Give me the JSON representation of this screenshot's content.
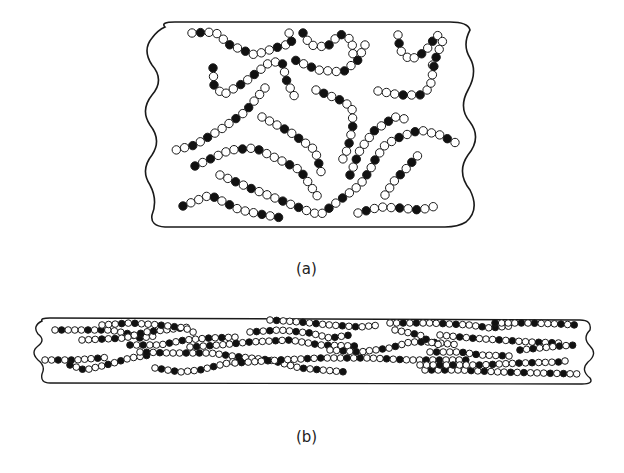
{
  "panel_a": {
    "label": "(a)",
    "description": "Randomly coiled polymer chains (unoriented)",
    "chains": [
      [
        [
          192,
          33
        ],
        [
          215,
          32
        ],
        [
          230,
          45
        ],
        [
          255,
          55
        ],
        [
          275,
          48
        ],
        [
          292,
          43
        ],
        [
          287,
          26
        ]
      ],
      [
        [
          303,
          33
        ],
        [
          310,
          45
        ],
        [
          327,
          47
        ],
        [
          340,
          34
        ],
        [
          352,
          40
        ],
        [
          353,
          55
        ]
      ],
      [
        [
          365,
          45
        ],
        [
          358,
          60
        ],
        [
          343,
          72
        ],
        [
          318,
          70
        ],
        [
          295,
          60
        ]
      ],
      [
        [
          398,
          35
        ],
        [
          400,
          50
        ],
        [
          410,
          60
        ],
        [
          425,
          52
        ],
        [
          437,
          35
        ],
        [
          443,
          40
        ],
        [
          435,
          60
        ],
        [
          430,
          70
        ]
      ],
      [
        [
          213,
          68
        ],
        [
          214,
          85
        ],
        [
          223,
          95
        ],
        [
          245,
          82
        ],
        [
          270,
          62
        ],
        [
          282,
          62
        ],
        [
          287,
          82
        ],
        [
          298,
          103
        ]
      ],
      [
        [
          265,
          88
        ],
        [
          245,
          112
        ],
        [
          220,
          130
        ],
        [
          195,
          145
        ],
        [
          176,
          150
        ]
      ],
      [
        [
          378,
          91
        ],
        [
          400,
          95
        ],
        [
          420,
          95
        ],
        [
          430,
          88
        ],
        [
          435,
          60
        ]
      ],
      [
        [
          316,
          90
        ],
        [
          340,
          100
        ],
        [
          352,
          107
        ],
        [
          353,
          125
        ],
        [
          348,
          148
        ],
        [
          340,
          165
        ]
      ],
      [
        [
          262,
          117
        ],
        [
          290,
          132
        ],
        [
          315,
          150
        ],
        [
          322,
          175
        ]
      ],
      [
        [
          195,
          166
        ],
        [
          230,
          150
        ],
        [
          255,
          148
        ],
        [
          280,
          160
        ],
        [
          300,
          170
        ],
        [
          320,
          200
        ]
      ],
      [
        [
          220,
          175
        ],
        [
          250,
          188
        ],
        [
          280,
          200
        ],
        [
          305,
          210
        ],
        [
          320,
          215
        ],
        [
          340,
          200
        ],
        [
          360,
          185
        ],
        [
          370,
          170
        ],
        [
          375,
          160
        ],
        [
          385,
          145
        ],
        [
          400,
          137
        ],
        [
          420,
          130
        ],
        [
          440,
          135
        ],
        [
          460,
          145
        ]
      ],
      [
        [
          350,
          175
        ],
        [
          360,
          150
        ],
        [
          375,
          130
        ],
        [
          395,
          117
        ],
        [
          410,
          120
        ]
      ],
      [
        [
          385,
          195
        ],
        [
          395,
          180
        ],
        [
          405,
          170
        ],
        [
          420,
          153
        ]
      ],
      [
        [
          183,
          206
        ],
        [
          210,
          195
        ],
        [
          240,
          210
        ],
        [
          265,
          215
        ],
        [
          282,
          218
        ]
      ],
      [
        [
          358,
          213
        ],
        [
          380,
          207
        ],
        [
          400,
          208
        ],
        [
          420,
          210
        ],
        [
          440,
          205
        ]
      ]
    ]
  },
  "panel_b": {
    "label": "(b)",
    "description": "Oriented (stretched) polymer chains",
    "chains": [
      [
        [
          55,
          330
        ],
        [
          110,
          330
        ],
        [
          130,
          334
        ],
        [
          140,
          338
        ],
        [
          155,
          336
        ]
      ],
      [
        [
          82,
          340
        ],
        [
          125,
          338
        ],
        [
          145,
          332
        ],
        [
          165,
          330
        ],
        [
          190,
          327
        ]
      ],
      [
        [
          130,
          345
        ],
        [
          160,
          345
        ],
        [
          185,
          340
        ],
        [
          210,
          338
        ],
        [
          240,
          337
        ]
      ],
      [
        [
          102,
          325
        ],
        [
          130,
          323
        ],
        [
          160,
          325
        ],
        [
          185,
          328
        ],
        [
          195,
          333
        ]
      ],
      [
        [
          45,
          360
        ],
        [
          75,
          360
        ],
        [
          100,
          358
        ],
        [
          110,
          357
        ]
      ],
      [
        [
          70,
          365
        ],
        [
          85,
          370
        ],
        [
          110,
          364
        ],
        [
          130,
          358
        ],
        [
          150,
          355
        ]
      ],
      [
        [
          140,
          352
        ],
        [
          170,
          353
        ],
        [
          210,
          353
        ],
        [
          240,
          357
        ],
        [
          270,
          360
        ],
        [
          300,
          368
        ],
        [
          345,
          372
        ]
      ],
      [
        [
          155,
          368
        ],
        [
          180,
          372
        ],
        [
          200,
          370
        ],
        [
          220,
          365
        ],
        [
          240,
          360
        ]
      ],
      [
        [
          190,
          347
        ],
        [
          220,
          345
        ],
        [
          250,
          342
        ],
        [
          290,
          340
        ],
        [
          320,
          345
        ],
        [
          355,
          346
        ]
      ],
      [
        [
          250,
          332
        ],
        [
          280,
          330
        ],
        [
          310,
          333
        ],
        [
          330,
          338
        ],
        [
          350,
          335
        ]
      ],
      [
        [
          270,
          320
        ],
        [
          300,
          322
        ],
        [
          330,
          325
        ],
        [
          360,
          327
        ],
        [
          380,
          325
        ]
      ],
      [
        [
          330,
          350
        ],
        [
          360,
          352
        ],
        [
          390,
          348
        ],
        [
          410,
          342
        ],
        [
          430,
          342
        ],
        [
          460,
          345
        ]
      ],
      [
        [
          390,
          323
        ],
        [
          430,
          323
        ],
        [
          470,
          325
        ],
        [
          490,
          328
        ],
        [
          510,
          326
        ]
      ],
      [
        [
          395,
          330
        ],
        [
          420,
          335
        ],
        [
          430,
          342
        ],
        [
          440,
          345
        ]
      ],
      [
        [
          440,
          335
        ],
        [
          470,
          338
        ],
        [
          500,
          340
        ],
        [
          530,
          342
        ],
        [
          560,
          343
        ]
      ],
      [
        [
          495,
          323
        ],
        [
          530,
          323
        ],
        [
          560,
          324
        ],
        [
          575,
          325
        ]
      ],
      [
        [
          430,
          352
        ],
        [
          460,
          352
        ],
        [
          480,
          355
        ],
        [
          510,
          356
        ]
      ],
      [
        [
          520,
          350
        ],
        [
          540,
          348
        ],
        [
          560,
          346
        ],
        [
          575,
          345
        ]
      ],
      [
        [
          235,
          363
        ],
        [
          280,
          360
        ],
        [
          320,
          358
        ],
        [
          370,
          358
        ],
        [
          410,
          360
        ],
        [
          440,
          360
        ],
        [
          470,
          360
        ]
      ],
      [
        [
          425,
          370
        ],
        [
          460,
          370
        ],
        [
          500,
          372
        ],
        [
          540,
          373
        ],
        [
          580,
          374
        ]
      ],
      [
        [
          420,
          365
        ],
        [
          450,
          365
        ],
        [
          480,
          365
        ],
        [
          520,
          363
        ],
        [
          560,
          362
        ],
        [
          570,
          360
        ]
      ]
    ]
  },
  "colors": {
    "line": "#1a1a1a",
    "bead_dark": "#111111",
    "bead_light": "#ffffff"
  }
}
